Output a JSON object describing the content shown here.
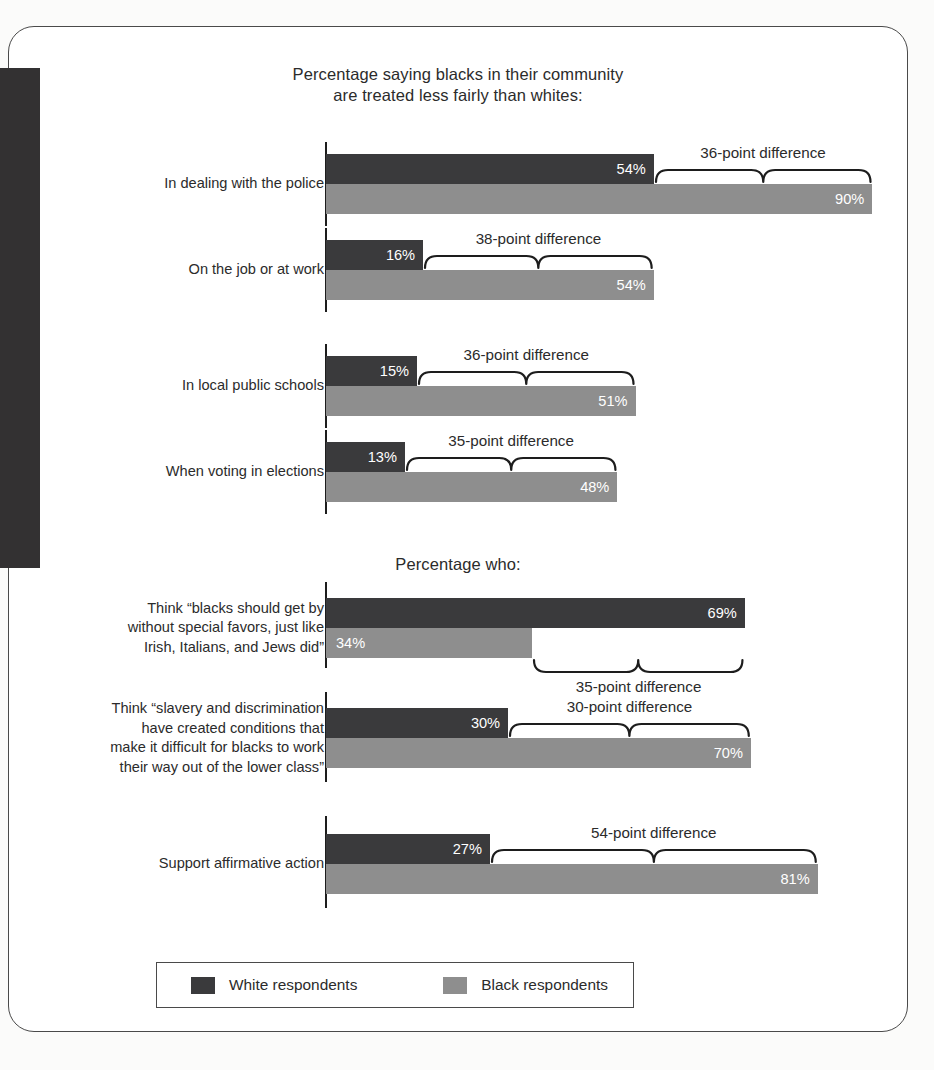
{
  "figure": {
    "section_titles": [
      "Percentage saying blacks in their community are treated less fairly than whites:",
      "Percentage who:"
    ],
    "title_line_1a": "Percentage saying blacks in their community",
    "title_line_1b": "are treated less fairly than whites:",
    "title_2": "Percentage who:"
  },
  "legend": {
    "white_label": "White respondents",
    "black_label": "Black respondents",
    "white_color": "#3a3a3c",
    "black_color": "#8e8e8e"
  },
  "chart_data": {
    "type": "bar",
    "orientation": "horizontal",
    "xlabel": "",
    "ylabel": "",
    "xlim": [
      0,
      100
    ],
    "grid": false,
    "legend_position": "bottom",
    "series": [
      {
        "name": "White respondents",
        "color": "#3a3a3c",
        "values": [
          54,
          16,
          15,
          13,
          69,
          30,
          27
        ]
      },
      {
        "name": "Black respondents",
        "color": "#8e8e8e",
        "values": [
          90,
          54,
          51,
          48,
          34,
          70,
          81
        ]
      }
    ],
    "categories": [
      "In dealing with the police",
      "On the job or at work",
      "In local public schools",
      "When voting in elections",
      "Think “blacks should get by without special favors, just like Irish, Italians, and Jews did”",
      "Think “slavery and discrimination have created conditions that make it difficult for blacks to work their way out of the lower class”",
      "Support affirmative action"
    ],
    "annotations": [
      "36-point difference",
      "38-point difference",
      "36-point difference",
      "35-point difference",
      "35-point difference",
      "30-point difference",
      "54-point difference"
    ]
  },
  "groups": [
    {
      "section": 1,
      "label_lines": [
        "In dealing with the police"
      ],
      "white_value": 54,
      "white_label": "54%",
      "black_value": 90,
      "black_label": "90%",
      "difference": "36-point difference",
      "brace_position": "above"
    },
    {
      "section": 1,
      "label_lines": [
        "On the job or at work"
      ],
      "white_value": 16,
      "white_label": "16%",
      "black_value": 54,
      "black_label": "54%",
      "difference": "38-point difference",
      "brace_position": "above"
    },
    {
      "section": 1,
      "label_lines": [
        "In local public schools"
      ],
      "white_value": 15,
      "white_label": "15%",
      "black_value": 51,
      "black_label": "51%",
      "difference": "36-point difference",
      "brace_position": "above"
    },
    {
      "section": 1,
      "label_lines": [
        "When voting in elections"
      ],
      "white_value": 13,
      "white_label": "13%",
      "black_value": 48,
      "black_label": "48%",
      "difference": "35-point difference",
      "brace_position": "above"
    },
    {
      "section": 2,
      "label_lines": [
        "Think “blacks should get by",
        "without special favors, just like",
        "Irish, Italians, and Jews did”"
      ],
      "white_value": 69,
      "white_label": "69%",
      "black_value": 34,
      "black_label": "34%",
      "difference": "35-point difference",
      "brace_position": "below"
    },
    {
      "section": 2,
      "label_lines": [
        "Think “slavery and discrimination",
        "have created conditions that",
        "make it difficult for blacks to work",
        "their way out of the lower class”"
      ],
      "white_value": 30,
      "white_label": "30%",
      "black_value": 70,
      "black_label": "70%",
      "difference": "30-point difference",
      "brace_position": "above"
    },
    {
      "section": 2,
      "label_lines": [
        "Support affirmative action"
      ],
      "white_value": 27,
      "white_label": "27%",
      "black_value": 81,
      "black_label": "81%",
      "difference": "54-point difference",
      "brace_position": "above"
    }
  ]
}
